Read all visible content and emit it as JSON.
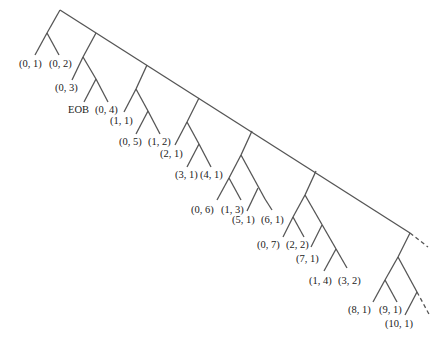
{
  "diagram": {
    "type": "binary-tree",
    "edge_color": "#555555",
    "text_color": "#222222",
    "leaves": [
      {
        "id": "l01",
        "label": "(0, 1)"
      },
      {
        "id": "l02",
        "label": "(0, 2)"
      },
      {
        "id": "l03",
        "label": "(0, 3)"
      },
      {
        "id": "eob",
        "label": "EOB"
      },
      {
        "id": "l04",
        "label": "(0, 4)"
      },
      {
        "id": "l11",
        "label": "(1, 1)"
      },
      {
        "id": "l05",
        "label": "(0, 5)"
      },
      {
        "id": "l12",
        "label": "(1, 2)"
      },
      {
        "id": "l21",
        "label": "(2, 1)"
      },
      {
        "id": "l31",
        "label": "(3, 1)"
      },
      {
        "id": "l41",
        "label": "(4, 1)"
      },
      {
        "id": "l06",
        "label": "(0, 6)"
      },
      {
        "id": "l13",
        "label": "(1, 3)"
      },
      {
        "id": "l51",
        "label": "(5, 1)"
      },
      {
        "id": "l61",
        "label": "(6, 1)"
      },
      {
        "id": "l07",
        "label": "(0, 7)"
      },
      {
        "id": "l22",
        "label": "(2, 2)"
      },
      {
        "id": "l71",
        "label": "(7, 1)"
      },
      {
        "id": "l14",
        "label": "(1, 4)"
      },
      {
        "id": "l32",
        "label": "(3, 2)"
      },
      {
        "id": "l81",
        "label": "(8, 1)"
      },
      {
        "id": "l91",
        "label": "(9, 1)"
      },
      {
        "id": "l101",
        "label": "(10, 1)"
      }
    ],
    "continuations": [
      "spine-continues-dashed",
      "subtree-continues-dashed"
    ]
  }
}
